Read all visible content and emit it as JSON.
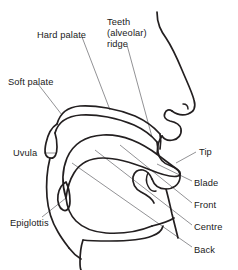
{
  "diagram": {
    "line_color": "#231f20",
    "leader_color": "#6d6e71",
    "background": "#ffffff",
    "labels": [
      {
        "id": "hard-palate",
        "text": "Hard palate",
        "x": 37,
        "y": 30,
        "align": "left"
      },
      {
        "id": "teeth-ridge-1",
        "text": "Teeth",
        "x": 107,
        "y": 17,
        "align": "left"
      },
      {
        "id": "teeth-ridge-2",
        "text": "(alveolar)",
        "x": 107,
        "y": 28,
        "align": "left"
      },
      {
        "id": "teeth-ridge-3",
        "text": "ridge",
        "x": 107,
        "y": 39,
        "align": "left"
      },
      {
        "id": "soft-palate",
        "text": "Soft palate",
        "x": 8,
        "y": 77,
        "align": "left"
      },
      {
        "id": "uvula",
        "text": "Uvula",
        "x": 13,
        "y": 148,
        "align": "left"
      },
      {
        "id": "epiglottis",
        "text": "Epiglottis",
        "x": 10,
        "y": 218,
        "align": "left"
      },
      {
        "id": "tip",
        "text": "Tip",
        "x": 199,
        "y": 147,
        "align": "left"
      },
      {
        "id": "blade",
        "text": "Blade",
        "x": 194,
        "y": 178,
        "align": "left"
      },
      {
        "id": "front",
        "text": "Front",
        "x": 194,
        "y": 200,
        "align": "left"
      },
      {
        "id": "centre",
        "text": "Centre",
        "x": 194,
        "y": 222,
        "align": "left"
      },
      {
        "id": "back",
        "text": "Back",
        "x": 194,
        "y": 245,
        "align": "left"
      }
    ],
    "parts": [
      "nose-profile",
      "hard-palate-arch",
      "soft-palate-uvula",
      "upper-lip",
      "upper-teeth",
      "lower-lip",
      "lower-teeth",
      "tongue-body",
      "epiglottis-flap",
      "pharynx-wall",
      "lower-jaw"
    ]
  }
}
